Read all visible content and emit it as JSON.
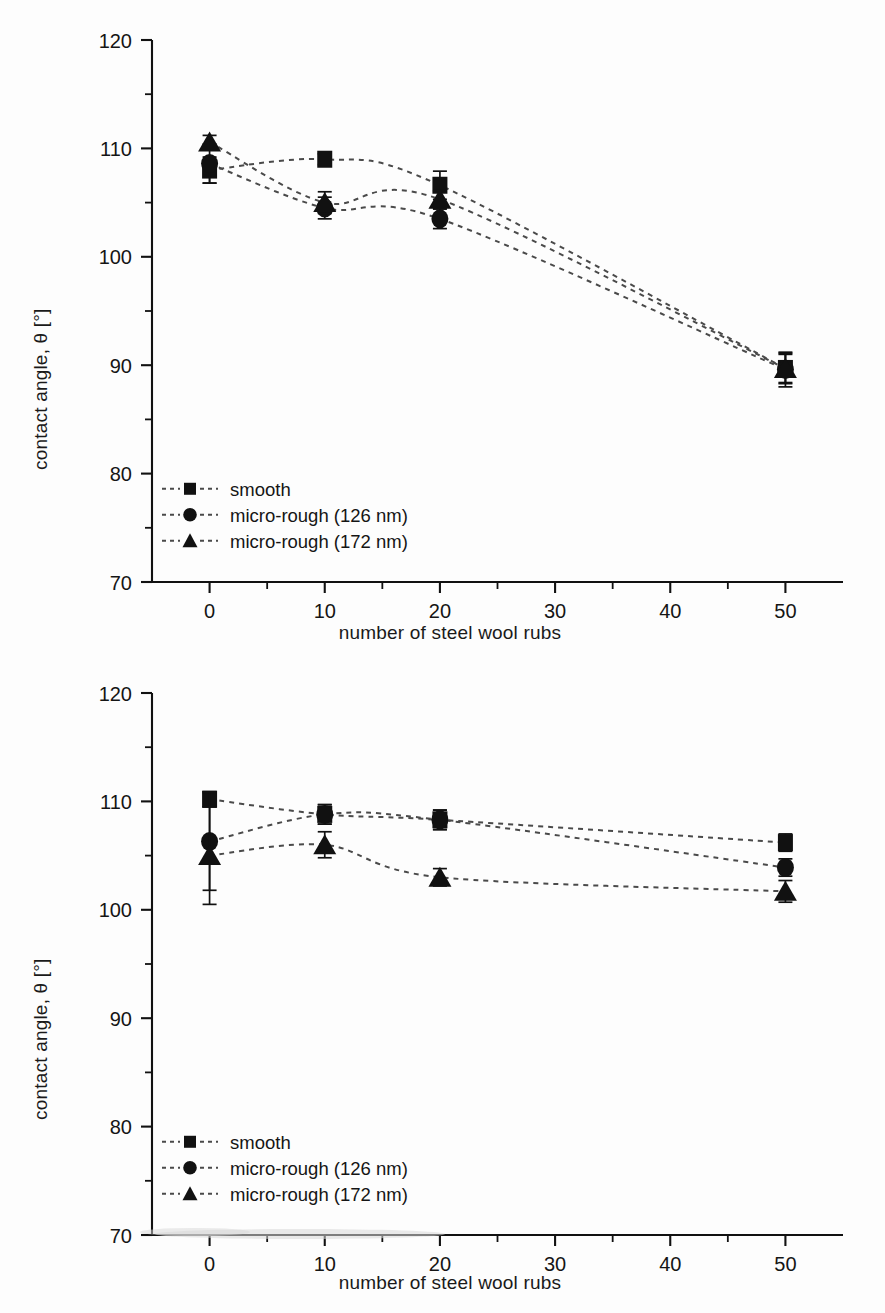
{
  "figure": {
    "panels": [
      {
        "id": "top",
        "ylabel": "contact angle, θ [°]",
        "xlabel": "number of steel wool rubs",
        "legend": [
          {
            "label": "smooth",
            "marker": "square"
          },
          {
            "label": "micro-rough (126 nm)",
            "marker": "circle"
          },
          {
            "label": "micro-rough (172 nm)",
            "marker": "triangle"
          }
        ]
      },
      {
        "id": "bottom",
        "ylabel": "contact angle, θ [°]",
        "xlabel": "number of steel wool rubs",
        "legend": [
          {
            "label": "smooth",
            "marker": "square"
          },
          {
            "label": "micro-rough (126 nm)",
            "marker": "circle"
          },
          {
            "label": "micro-rough (172 nm)",
            "marker": "triangle"
          }
        ]
      }
    ],
    "axis": {
      "x_ticks": [
        "0",
        "10",
        "20",
        "30",
        "40",
        "50"
      ],
      "y_ticks": [
        "70",
        "80",
        "90",
        "100",
        "110",
        "120"
      ]
    },
    "colors": {
      "marker": "#111111",
      "line": "#4a4a4a",
      "axis": "#111111",
      "background": "#fdfdfd"
    }
  },
  "chart_data": [
    {
      "type": "scatter",
      "panel": "top",
      "title": "",
      "xlabel": "number of steel wool rubs",
      "ylabel": "contact angle, θ [°]",
      "xlim": [
        -5,
        55
      ],
      "ylim": [
        70,
        120
      ],
      "x_ticks": [
        0,
        10,
        20,
        30,
        40,
        50
      ],
      "y_ticks": [
        70,
        80,
        90,
        100,
        110,
        120
      ],
      "x_minor_ticks": [
        5,
        15,
        25,
        35,
        45
      ],
      "y_minor_ticks": [
        75,
        85,
        95,
        105,
        115
      ],
      "grid": false,
      "legend_position": "lower-left",
      "x": [
        0,
        10,
        20,
        50
      ],
      "series": [
        {
          "name": "smooth",
          "marker": "square",
          "values": [
            108.0,
            109.0,
            106.6,
            89.7
          ],
          "errors": [
            1.2,
            0.5,
            1.3,
            1.3
          ]
        },
        {
          "name": "micro-rough (126 nm)",
          "marker": "circle",
          "values": [
            108.6,
            104.5,
            103.5,
            89.6
          ],
          "errors": [
            1.8,
            1.0,
            0.9,
            1.6
          ]
        },
        {
          "name": "micro-rough (172 nm)",
          "marker": "triangle",
          "values": [
            110.6,
            105.0,
            105.3,
            89.7
          ],
          "errors": [
            0.6,
            1.0,
            0.8,
            1.4
          ]
        }
      ]
    },
    {
      "type": "scatter",
      "panel": "bottom",
      "title": "",
      "xlabel": "number of steel wool rubs",
      "ylabel": "contact angle, θ [°]",
      "xlim": [
        -5,
        55
      ],
      "ylim": [
        70,
        120
      ],
      "x_ticks": [
        0,
        10,
        20,
        30,
        40,
        50
      ],
      "y_ticks": [
        70,
        80,
        90,
        100,
        110,
        120
      ],
      "x_minor_ticks": [
        5,
        15,
        25,
        35,
        45
      ],
      "y_minor_ticks": [
        75,
        85,
        95,
        105,
        115
      ],
      "grid": false,
      "legend_position": "lower-left",
      "x": [
        0,
        10,
        20,
        50
      ],
      "series": [
        {
          "name": "smooth",
          "marker": "square",
          "values": [
            110.2,
            108.8,
            108.3,
            106.2
          ],
          "errors": [
            0.7,
            0.9,
            0.9,
            0.8
          ]
        },
        {
          "name": "micro-rough (126 nm)",
          "marker": "circle",
          "values": [
            106.3,
            108.8,
            108.3,
            103.9
          ],
          "errors": [
            4.5,
            0.9,
            0.9,
            0.8
          ]
        },
        {
          "name": "micro-rough (172 nm)",
          "marker": "triangle",
          "values": [
            105.0,
            106.0,
            103.0,
            101.7
          ],
          "errors": [
            4.5,
            1.2,
            0.8,
            1.0
          ]
        }
      ]
    }
  ]
}
